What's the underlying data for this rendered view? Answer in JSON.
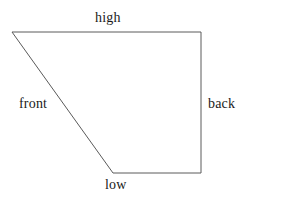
{
  "diagram": {
    "type": "line-drawing",
    "title": "",
    "background_color": "#ffffff",
    "stroke_color": "#5a5a5a",
    "stroke_width": 1,
    "text_color": "#1a1a1a",
    "canvas": {
      "width": 284,
      "height": 198
    },
    "shape": {
      "name": "quadrilateral",
      "closed": true,
      "vertices": [
        {
          "id": "top-left",
          "x": 12,
          "y": 32
        },
        {
          "id": "top-right",
          "x": 201,
          "y": 32
        },
        {
          "id": "bottom-right",
          "x": 201,
          "y": 173
        },
        {
          "id": "bottom-left",
          "x": 113,
          "y": 173
        }
      ],
      "points_attr": "12,32 201,32 201,173 113,173"
    },
    "edges": [
      {
        "id": "top",
        "label": "high",
        "from": "top-left",
        "to": "top-right"
      },
      {
        "id": "right",
        "label": "back",
        "from": "top-right",
        "to": "bottom-right"
      },
      {
        "id": "bottom",
        "label": "low",
        "from": "bottom-right",
        "to": "bottom-left"
      },
      {
        "id": "left",
        "label": "front",
        "from": "bottom-left",
        "to": "top-left"
      }
    ],
    "labels": {
      "high": "high",
      "front": "front",
      "back": "back",
      "low": "low"
    }
  }
}
